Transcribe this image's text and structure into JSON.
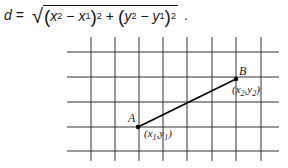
{
  "formula": {
    "lhs": "d",
    "equals": "=",
    "x2": "x",
    "x2_sub": "2",
    "x1": "x",
    "x1_sub": "1",
    "y2": "y",
    "y2_sub": "2",
    "y1": "y",
    "y1_sub": "1",
    "minus": "−",
    "plus": "+",
    "exponent": "2",
    "period": "."
  },
  "diagram": {
    "grid": {
      "vertical_x": [
        91,
        115,
        139,
        163,
        187,
        212,
        236,
        261
      ],
      "vertical_y_range": [
        37,
        161
      ],
      "horizontal_y": [
        52,
        77,
        102,
        127,
        151
      ],
      "horizontal_x_range": [
        67,
        279
      ],
      "color": "#333333"
    },
    "segment": {
      "color": "#000000"
    },
    "point_a": {
      "x": 138,
      "y": 127,
      "name": "A",
      "coords_label": "(x1,y1)"
    },
    "point_b": {
      "x": 236,
      "y": 79,
      "name": "B",
      "coords_label": "(x2,y2)"
    }
  }
}
